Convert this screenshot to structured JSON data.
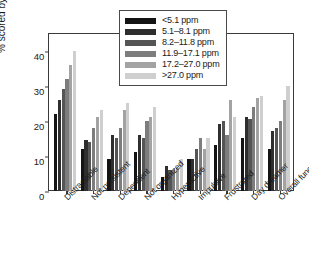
{
  "chart_data": {
    "type": "bar",
    "title": "",
    "xlabel": "",
    "ylabel": "% scored by teachers",
    "ylim": [
      0,
      45
    ],
    "yticks": [
      0,
      10,
      20,
      30,
      40
    ],
    "grid": false,
    "legend_position": "top-center",
    "legend_title": "",
    "categories": [
      "Distractable",
      "Not persistent",
      "Dependent",
      "Not organized",
      "Hyperactive",
      "Impulsive",
      "Frustrated",
      "Day dreamer",
      "Overall function"
    ],
    "series": [
      {
        "name": "<5.1 ppm",
        "color": "#141414",
        "values": [
          22,
          12,
          9,
          11,
          4,
          9,
          13,
          15,
          12
        ]
      },
      {
        "name": "5.1–8.1 ppm",
        "color": "#2e2e2e",
        "values": [
          26,
          14.5,
          16,
          16,
          7,
          9,
          19,
          21,
          17
        ]
      },
      {
        "name": "8.2–11.8 ppm",
        "color": "#555555",
        "values": [
          29,
          14,
          15,
          15,
          6,
          12,
          20,
          20.5,
          18
        ]
      },
      {
        "name": "11.9–17.1 ppm",
        "color": "#7d7d7d",
        "values": [
          32,
          18,
          18,
          20,
          6,
          15,
          16,
          24,
          20
        ]
      },
      {
        "name": "17.2–27.0 ppm",
        "color": "#a3a3a3",
        "values": [
          36,
          21,
          23,
          21,
          6.5,
          12,
          26,
          26.5,
          26
        ]
      },
      {
        "name": ">27.0 ppm",
        "color": "#cfcfcf",
        "values": [
          40,
          23,
          25,
          24,
          9,
          15,
          21,
          27,
          30
        ]
      }
    ]
  }
}
